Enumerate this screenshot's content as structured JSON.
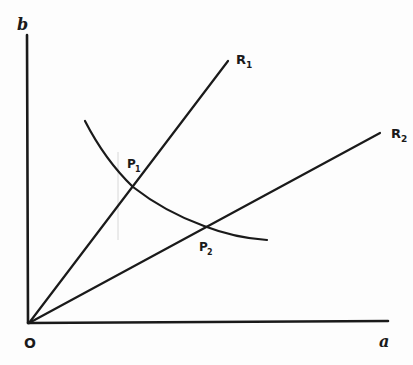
{
  "diagram": {
    "type": "economics-indifference-rays",
    "axes": {
      "x_label": "a",
      "y_label": "b",
      "origin_label": "O"
    },
    "rays": [
      {
        "id": "R1",
        "label": "R",
        "subscript": "1",
        "from": [
          29,
          323
        ],
        "to": [
          228,
          61
        ]
      },
      {
        "id": "R2",
        "label": "R",
        "subscript": "2",
        "from": [
          29,
          323
        ],
        "to": [
          380,
          133
        ]
      }
    ],
    "curve": {
      "description": "downward-sloping convex curve",
      "start": [
        85,
        121
      ],
      "end": [
        267,
        240
      ]
    },
    "points": [
      {
        "id": "P1",
        "label": "P",
        "subscript": "1",
        "at": [
          133,
          187
        ]
      },
      {
        "id": "P2",
        "label": "P",
        "subscript": "2",
        "at": [
          204,
          226
        ]
      }
    ],
    "colors": {
      "ink": "#1a1a1a",
      "paper": "#fdfdfd",
      "faint_line": "#d8d8d8"
    }
  }
}
